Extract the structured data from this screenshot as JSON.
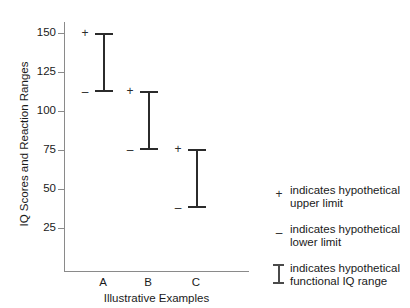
{
  "chart_data": {
    "type": "bar",
    "subtype": "range-interval",
    "title": "",
    "xlabel": "Illustrative Examples",
    "ylabel": "IQ Scores and Reaction Ranges",
    "categories": [
      "A",
      "B",
      "C"
    ],
    "ylim": [
      0,
      160
    ],
    "yticks": [
      25,
      50,
      75,
      100,
      125,
      150
    ],
    "grid": false,
    "legend_position": "right",
    "series": [
      {
        "name": "functional IQ range",
        "upper_name": "hypothetical upper limit",
        "lower_name": "hypothetical lower limit",
        "points": [
          {
            "category": "A",
            "upper": 150,
            "lower": 112
          },
          {
            "category": "B",
            "upper": 113,
            "lower": 75
          },
          {
            "category": "C",
            "upper": 75.5,
            "lower": 38
          }
        ]
      }
    ],
    "legend": [
      {
        "symbol": "+",
        "symbol_name": "plus-marker",
        "line1": "indicates hypothetical",
        "line2": "upper limit"
      },
      {
        "symbol": "–",
        "symbol_name": "minus-marker",
        "line1": "indicates hypothetical",
        "line2": "lower limit"
      },
      {
        "symbol": "ibeam",
        "symbol_name": "ibeam-marker",
        "line1": "indicates hypothetical",
        "line2": "functional IQ range"
      }
    ],
    "colors": {
      "bar": "#2b2b2b",
      "axis": "#8a8a8a",
      "text": "#1a1a1a",
      "background": "#ffffff"
    }
  }
}
